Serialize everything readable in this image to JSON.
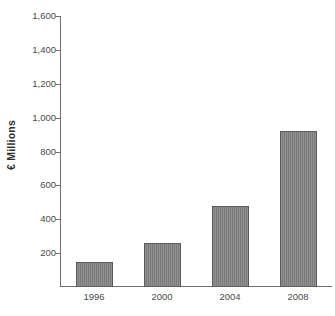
{
  "chart_data": {
    "type": "bar",
    "title": "",
    "subtitle": "",
    "xlabel": "",
    "ylabel": "€ Millions",
    "categories": [
      "1996",
      "2000",
      "2004",
      "2008"
    ],
    "values": [
      150,
      260,
      480,
      920
    ],
    "series": [
      {
        "name": "",
        "values": [
          150,
          260,
          480,
          920
        ]
      }
    ],
    "ylim": [
      0,
      1600
    ],
    "ytick_step": 200,
    "ytick_labels": [
      "1,600",
      "1,400",
      "1,200",
      "1,000",
      "800",
      "600",
      "400",
      "200"
    ],
    "ytick_values": [
      1600,
      1400,
      1200,
      1000,
      800,
      600,
      400,
      200
    ],
    "grid": false,
    "legend": false,
    "legend_position": "none",
    "bar_color": "#808080",
    "bar_edge_color": "#5a5a5a",
    "axis_color": "#6f6f6f",
    "background_color": "#ffffff",
    "annotations": []
  },
  "caption_sliver": " "
}
